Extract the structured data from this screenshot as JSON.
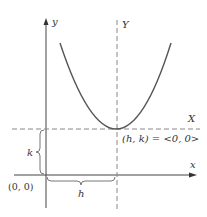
{
  "diagram": {
    "axis_labels": {
      "y": "y",
      "x": "x",
      "Y": "Y",
      "X": "X"
    },
    "origin_label": "(0, 0)",
    "vertex_label": "(h, k) = <0, 0>",
    "h_label": "h",
    "k_label": "k",
    "colors": {
      "curve": "#555555",
      "axis": "#444444",
      "dash": "#888888",
      "brace": "#777777"
    }
  }
}
